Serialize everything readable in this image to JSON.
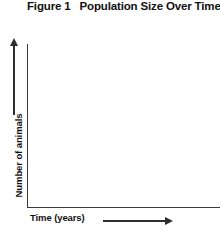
{
  "figure": {
    "label": "Figure 1",
    "title": "Population Size Over Time"
  },
  "axes": {
    "y_label": "Number of animals",
    "x_label": "Time (years)",
    "y_arrow_icon": "arrow-up-icon",
    "x_arrow_icon": "arrow-right-icon"
  },
  "chart_data": {
    "type": "line",
    "title": "Population Size Over Time",
    "subtitle": "Figure 1",
    "xlabel": "Time (years)",
    "ylabel": "Number of animals",
    "series": [],
    "x": [],
    "categories": [],
    "values": [],
    "xticks": [],
    "yticks": [],
    "xticklabels": [],
    "yticklabels": [],
    "grid": false,
    "legend": false
  },
  "colors": {
    "axis": "#3a3a3a",
    "arrow": "#2e2e2e",
    "text": "#111111",
    "background": "#ffffff"
  }
}
